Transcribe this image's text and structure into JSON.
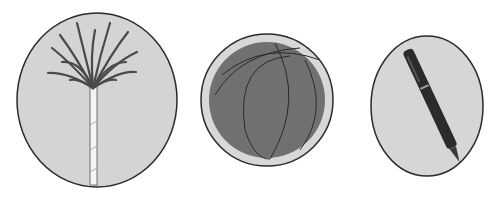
{
  "figure": {
    "items": [
      {
        "id": "palm-tree",
        "label": "Palm tree",
        "background": "#d4d4d4"
      },
      {
        "id": "ball",
        "label": "Ball",
        "background": "#d8d8d8",
        "fill": "#707070"
      },
      {
        "id": "pen",
        "label": "Pen",
        "background": "#d6d6d6",
        "fill": "#2b2b2b"
      }
    ]
  },
  "colors": {
    "outline": "#2a2a2a",
    "leaf": "#4a4a4a",
    "trunk": "#f4f4f4"
  }
}
